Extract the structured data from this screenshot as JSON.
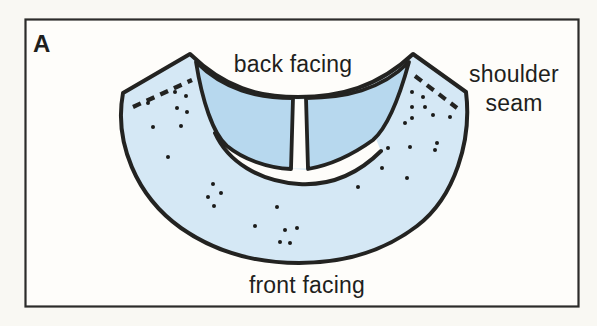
{
  "figure": {
    "panel_letter": "A",
    "labels": {
      "back_facing": "back facing",
      "shoulder_seam_line1": "shoulder",
      "shoulder_seam_line2": "seam",
      "front_facing": "front facing"
    },
    "colors": {
      "page_bg": "#f9f8f3",
      "frame_bg": "#fefdfa",
      "frame_border": "#2c2c2a",
      "outline": "#232321",
      "front_facing_fill": "#d5e8f5",
      "back_facing_fill": "#b7d8ee",
      "neck_opening_fill": "#fefdfa",
      "text": "#1f1f1d",
      "dot": "#1b1b19"
    },
    "pattern_dots": [
      [
        148,
        103
      ],
      [
        175,
        92
      ],
      [
        186,
        96
      ],
      [
        177,
        108
      ],
      [
        187,
        112
      ],
      [
        181,
        126
      ],
      [
        153,
        127
      ],
      [
        168,
        157
      ],
      [
        213,
        184
      ],
      [
        221,
        193
      ],
      [
        208,
        197
      ],
      [
        214,
        206
      ],
      [
        255,
        226
      ],
      [
        277,
        207
      ],
      [
        285,
        230
      ],
      [
        297,
        228
      ],
      [
        280,
        242
      ],
      [
        290,
        243
      ],
      [
        358,
        187
      ],
      [
        382,
        168
      ],
      [
        388,
        148
      ],
      [
        407,
        178
      ],
      [
        410,
        147
      ],
      [
        435,
        150
      ],
      [
        412,
        92
      ],
      [
        423,
        97
      ],
      [
        412,
        107
      ],
      [
        425,
        107
      ],
      [
        433,
        115
      ],
      [
        412,
        118
      ],
      [
        450,
        117
      ],
      [
        405,
        123
      ],
      [
        437,
        143
      ]
    ]
  }
}
